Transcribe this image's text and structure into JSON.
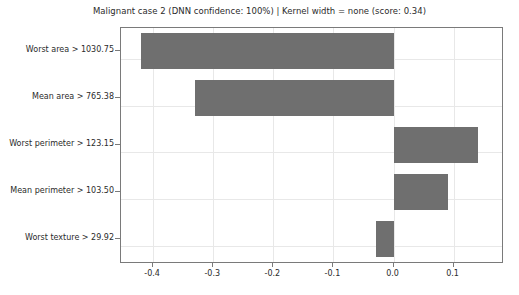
{
  "chart_data": {
    "type": "bar",
    "orientation": "horizontal",
    "title": "Malignant case 2 (DNN confidence: 100%) | Kernel width = none (score: 0.34)",
    "xlabel": "",
    "ylabel": "",
    "categories": [
      "Worst area > 1030.75",
      "Mean area > 765.38",
      "Worst perimeter > 123.15",
      "Mean perimeter > 103.50",
      "Worst texture > 29.92"
    ],
    "values": [
      -0.42,
      -0.33,
      0.14,
      0.09,
      -0.03
    ],
    "xticks": [
      -0.4,
      -0.3,
      -0.2,
      -0.1,
      0.0,
      0.1
    ],
    "xticklabels": [
      "-0.4",
      "-0.3",
      "-0.2",
      "-0.1",
      "0.0",
      "0.1"
    ],
    "xlim": [
      -0.4535,
      0.1805
    ],
    "grid": true,
    "legend": null,
    "bar_color": "#6f6f6f",
    "grid_color": "#e8e8e8",
    "axes_color": "#7a7a7a"
  }
}
